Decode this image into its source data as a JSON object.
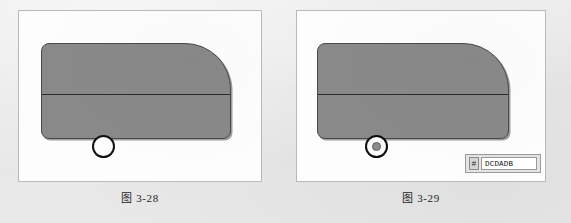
{
  "page": {
    "background_color": "#eaeaea"
  },
  "figures": [
    {
      "id": "figure-3-28",
      "caption": "图 3-28",
      "shape": {
        "name": "rounded-body-outline",
        "fill_color": "#898989",
        "stroke_color": "#4a4a4a",
        "divider_line_color": "#2c2c2c"
      },
      "marker": {
        "type": "circle",
        "label": "wheel-circle",
        "fill_color": "#fdfdfd",
        "stroke_color": "#111111"
      },
      "widget": null
    },
    {
      "id": "figure-3-29",
      "caption": "图 3-29",
      "shape": {
        "name": "rounded-body-outline",
        "fill_color": "#898989",
        "stroke_color": "#4a4a4a",
        "divider_line_color": "#2c2c2c"
      },
      "marker": {
        "type": "concentric-circle",
        "label": "snap-point-marker",
        "fill_color": "#fdfdfd",
        "stroke_color": "#0c0c0c",
        "inner_color": "#8c8c8c"
      },
      "widget": {
        "name": "tag-input-widget",
        "hash_icon": "#",
        "value": "DCDADB",
        "placeholder": "DCDADB"
      }
    }
  ]
}
